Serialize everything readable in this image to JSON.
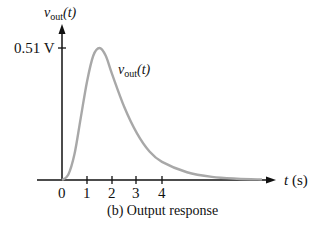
{
  "chart_data": {
    "type": "line",
    "title": "(b)  Output response",
    "xlabel": "t (s)",
    "ylabel": "v_out(t)",
    "series_label": "v_out(t)",
    "x_ticks": [
      "0",
      "1",
      "2",
      "3",
      "4"
    ],
    "y_ticks": [
      "0.51 V"
    ],
    "peak": {
      "t": 1.5,
      "v": 0.51
    },
    "x": [
      0,
      0.25,
      0.5,
      0.75,
      1.0,
      1.25,
      1.5,
      1.75,
      2.0,
      2.5,
      3.0,
      3.5,
      4.0,
      5.0,
      6.0,
      7.0,
      8.0
    ],
    "values": [
      0,
      0.02,
      0.1,
      0.24,
      0.38,
      0.48,
      0.51,
      0.48,
      0.41,
      0.28,
      0.18,
      0.11,
      0.07,
      0.03,
      0.012,
      0.005,
      0.002
    ],
    "xlim": [
      -1,
      8.5
    ],
    "ylim": [
      0,
      0.6
    ],
    "grid": false,
    "colors": {
      "curve": "#a8a8a8",
      "axis": "#111111"
    }
  },
  "labels": {
    "y_axis_v": "v",
    "y_axis_sub": "out",
    "y_axis_t": "(t)",
    "curve_v": "v",
    "curve_sub": "out",
    "curve_t": "(t)",
    "y_tick": "0.51 V",
    "x_axis": "t (s)",
    "x_t": "t",
    "x_unit": "(s)",
    "caption": "(b)  Output response",
    "ticks": [
      "0",
      "1",
      "2",
      "3",
      "4"
    ]
  }
}
